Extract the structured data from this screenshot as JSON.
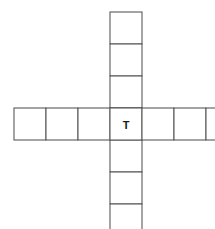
{
  "diagram": {
    "type": "cross-grid",
    "center_label": "T",
    "colors": {
      "stroke": "#59595b",
      "fill": "#ffffff",
      "label": "#1b1b1b",
      "background": "#ffffff"
    },
    "geometry": {
      "cell_size": 32,
      "origin_x": 14,
      "origin_y": 12,
      "center_col_index": 3,
      "center_row_index": 3
    },
    "arms": {
      "left_cells": 3,
      "right_cells": 3,
      "up_cells": 3,
      "down_cells": 3
    },
    "counts": {
      "horizontal_cells": 7,
      "vertical_cells": 7,
      "total_cells": 13
    },
    "horizontal_row": [
      {
        "index": 0,
        "label": ""
      },
      {
        "index": 1,
        "label": ""
      },
      {
        "index": 2,
        "label": ""
      },
      {
        "index": 3,
        "label": "T"
      },
      {
        "index": 4,
        "label": ""
      },
      {
        "index": 5,
        "label": ""
      },
      {
        "index": 6,
        "label": ""
      }
    ],
    "vertical_column": [
      {
        "index": 0,
        "label": ""
      },
      {
        "index": 1,
        "label": ""
      },
      {
        "index": 2,
        "label": ""
      },
      {
        "index": 3,
        "label": "T"
      },
      {
        "index": 4,
        "label": ""
      },
      {
        "index": 5,
        "label": ""
      },
      {
        "index": 6,
        "label": ""
      }
    ]
  }
}
